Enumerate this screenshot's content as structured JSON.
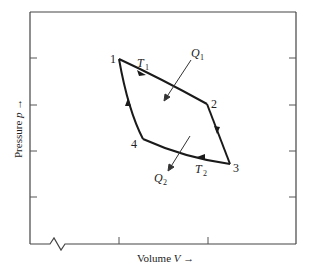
{
  "diagram": {
    "type": "pv-cycle",
    "title": "",
    "axes": {
      "x_label": "Volume",
      "x_symbol": "V",
      "x_arrow": "→",
      "y_label": "Pressure",
      "y_symbol": "p",
      "y_arrow": "→",
      "axis_break": "x-axis-origin"
    },
    "points": [
      {
        "id": "1",
        "label": "1"
      },
      {
        "id": "2",
        "label": "2"
      },
      {
        "id": "3",
        "label": "3"
      },
      {
        "id": "4",
        "label": "4"
      }
    ],
    "paths": [
      {
        "from": "1",
        "to": "2",
        "label": "T",
        "sub": "1",
        "direction": "1→2"
      },
      {
        "from": "2",
        "to": "3",
        "direction": "2→3"
      },
      {
        "from": "3",
        "to": "4",
        "label": "T",
        "sub": "2",
        "direction": "3→4"
      },
      {
        "from": "4",
        "to": "1",
        "direction": "4→1"
      }
    ],
    "heat_flows": [
      {
        "label": "Q",
        "sub": "1",
        "direction": "in"
      },
      {
        "label": "Q",
        "sub": "2",
        "direction": "out"
      }
    ]
  }
}
